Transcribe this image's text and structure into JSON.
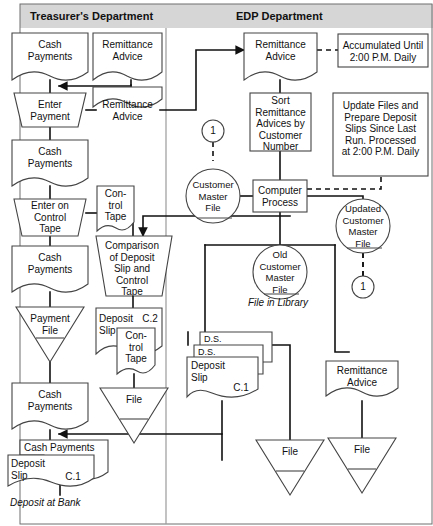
{
  "diagram": {
    "headers": [
      {
        "id": "treasurer",
        "label": "Treasurer's Department"
      },
      {
        "id": "edp",
        "label": "EDP Department"
      }
    ],
    "colors": {
      "header_band": "#d6d6d6",
      "stroke": "#333333",
      "flowline": "#111111",
      "text": "#111111",
      "background": "#ffffff"
    },
    "nodes": {
      "cash_payments_1": {
        "label": "Cash\nPayments",
        "shape": "document"
      },
      "remittance_advice_1": {
        "label": "Remittance\nAdvice",
        "shape": "document"
      },
      "enter_payment": {
        "label": "Enter\nPayment",
        "shape": "manual-operation"
      },
      "remittance_advice_2": {
        "label": "Remittance\nAdvice",
        "shape": "document"
      },
      "cash_payments_2": {
        "label": "Cash\nPayments",
        "shape": "document"
      },
      "enter_on_control_tape": {
        "label": "Enter on\nControl\nTape",
        "shape": "manual-operation"
      },
      "control_tape_1": {
        "label": "Con-\ntrol\nTape",
        "shape": "document"
      },
      "cash_payments_3": {
        "label": "Cash\nPayments",
        "shape": "document"
      },
      "comparison": {
        "label": "Comparison\nof Deposit\nSlip and\nControl\nTape",
        "shape": "manual-operation"
      },
      "payment_file": {
        "label": "Payment\nFile",
        "shape": "offline-storage"
      },
      "deposit_slip_c2": {
        "label": "Deposit\nSlip",
        "shape": "document",
        "ref": "C.2"
      },
      "control_tape_2": {
        "label": "Con-\ntrol\nTape",
        "shape": "document"
      },
      "file_left": {
        "label": "File",
        "shape": "offline-storage"
      },
      "cash_payments_4": {
        "label": "Cash\nPayments",
        "shape": "document"
      },
      "cash_payments_bank": {
        "label": "Cash Payments",
        "shape": "document"
      },
      "deposit_slip_bank": {
        "label": "Deposit\nSlip",
        "shape": "document",
        "ref": "C.1"
      },
      "deposit_caption": {
        "label": "Deposit at Bank"
      },
      "connector_1_left": {
        "label": "1",
        "shape": "connector"
      },
      "customer_master_file": {
        "label": "Customer\nMaster\nFile",
        "shape": "magnetic-disk"
      },
      "remittance_advice_edp": {
        "label": "Remittance\nAdvice",
        "shape": "document"
      },
      "accumulated_note": {
        "label": "Accumulated Until\n2:00 P.M. Daily",
        "shape": "annotation"
      },
      "sort_remittance": {
        "label": "Sort\nRemittance\nAdvices by\nCustomer\nNumber",
        "shape": "process"
      },
      "update_note": {
        "label": "Update Files and\nPrepare Deposit\nSlips Since Last\nRun. Processed\nat 2:00 P.M. Daily",
        "shape": "annotation"
      },
      "computer_process": {
        "label": "Computer\nProcess",
        "shape": "process"
      },
      "updated_customer_master_file": {
        "label": "Updated\nCustomer\nMaster\nFile",
        "shape": "magnetic-disk"
      },
      "connector_1_right": {
        "label": "1",
        "shape": "connector"
      },
      "old_customer_master_file": {
        "label": "Old\nCustomer\nMaster\nFile",
        "shape": "magnetic-disk"
      },
      "file_in_library_caption": {
        "label": "File in Library"
      },
      "ds_stack_top": {
        "label": "D.S.",
        "shape": "document"
      },
      "ds_stack_mid": {
        "label": "D.S.",
        "shape": "document"
      },
      "deposit_slip_c1_edp": {
        "label": "Deposit\nSlip",
        "shape": "document",
        "ref": "C.1"
      },
      "file_mid": {
        "label": "File",
        "shape": "offline-storage"
      },
      "remittance_advice_out": {
        "label": "Remittance\nAdvice",
        "shape": "document"
      },
      "file_right": {
        "label": "File",
        "shape": "offline-storage"
      }
    }
  }
}
